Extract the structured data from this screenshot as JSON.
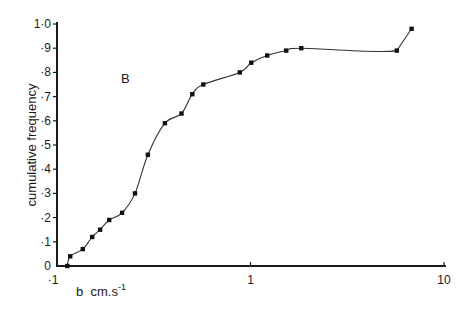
{
  "chart_data": {
    "type": "line",
    "title": "",
    "panel_label": "B",
    "xlabel": "b  cm.s",
    "xlabel_superscript": "-1",
    "ylabel": "cumulative frequency",
    "xscale": "log",
    "xlim": [
      0.1,
      10
    ],
    "ylim": [
      0,
      1.0
    ],
    "grid": false,
    "legend": null,
    "x_ticks": [
      {
        "value": 0.1,
        "label": "·1"
      },
      {
        "value": 1,
        "label": "1"
      },
      {
        "value": 10,
        "label": "10"
      }
    ],
    "y_ticks": [
      {
        "value": 0.0,
        "label": "0"
      },
      {
        "value": 0.1,
        "label": "·1"
      },
      {
        "value": 0.2,
        "label": "·2"
      },
      {
        "value": 0.3,
        "label": "·3"
      },
      {
        "value": 0.4,
        "label": "·4"
      },
      {
        "value": 0.5,
        "label": "·5"
      },
      {
        "value": 0.6,
        "label": "·6"
      },
      {
        "value": 0.7,
        "label": "·7"
      },
      {
        "value": 0.8,
        "label": "·8"
      },
      {
        "value": 0.9,
        "label": "·9"
      },
      {
        "value": 1.0,
        "label": "1·0"
      }
    ],
    "series": [
      {
        "name": "cumulative frequency",
        "marker": "square-dot",
        "line": "smooth",
        "x": [
          0.113,
          0.117,
          0.136,
          0.152,
          0.167,
          0.186,
          0.217,
          0.253,
          0.295,
          0.361,
          0.44,
          0.5,
          0.57,
          0.88,
          1.01,
          1.22,
          1.53,
          1.83,
          5.7,
          6.8
        ],
        "y": [
          0.0,
          0.04,
          0.07,
          0.12,
          0.15,
          0.19,
          0.22,
          0.3,
          0.46,
          0.59,
          0.63,
          0.71,
          0.75,
          0.8,
          0.84,
          0.87,
          0.89,
          0.9,
          0.89,
          0.98
        ]
      }
    ]
  }
}
